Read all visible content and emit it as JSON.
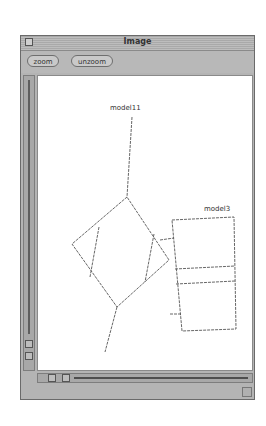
{
  "window": {
    "title": "Image",
    "close_icon": "close-box-icon"
  },
  "toolbar": {
    "zoom_label": "zoom",
    "unzoom_label": "unzoom"
  },
  "canvas": {
    "background": "#ffffff",
    "line_color": "#555555",
    "nodes": [
      {
        "id": "model11",
        "label": "model11"
      },
      {
        "id": "model3",
        "label": "model3"
      }
    ]
  },
  "scrollbars": {
    "vertical": {
      "icon": "vertical-scrollbar"
    },
    "horizontal": {
      "icon": "horizontal-scrollbar"
    }
  }
}
